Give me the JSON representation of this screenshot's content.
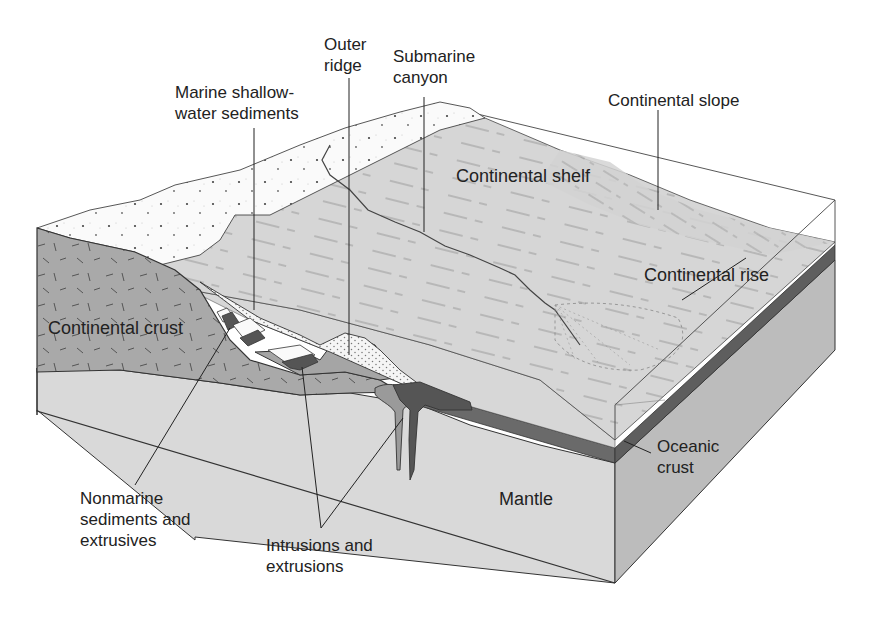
{
  "figure": {
    "type": "block-diagram",
    "colors": {
      "background": "#ffffff",
      "land_surface": "#f4f4f4",
      "sea_floor": "#d4d4d4",
      "continental_crust": "#a8a8a8",
      "mantle": "#d8d8d8",
      "mantle_side": "#bdbdbd",
      "oceanic_crust": "#6e6e6e",
      "intrusions_dark": "#5a5a5a",
      "intrusions_light": "#9a9a9a",
      "marine_sediments": "#f2f2f2",
      "outline": "#333333"
    }
  },
  "labels": {
    "outer_ridge": "Outer\nridge",
    "submarine_canyon": "Submarine\ncanyon",
    "marine_shallow_water_sediments": "Marine shallow-\nwater sediments",
    "continental_slope": "Continental slope",
    "continental_shelf": "Continental shelf",
    "continental_rise": "Continental rise",
    "continental_crust": "Continental crust",
    "oceanic_crust": "Oceanic\ncrust",
    "mantle": "Mantle",
    "nonmarine_sediments": "Nonmarine\nsediments and\nextrusives",
    "intrusions_and_extrusions": "Intrusions and\nextrusions"
  }
}
